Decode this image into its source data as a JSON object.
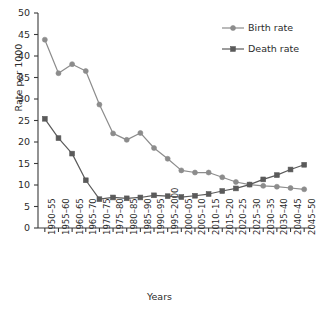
{
  "chart_data": {
    "type": "line",
    "title": "",
    "xlabel": "Years",
    "ylabel": "Rate per 1000",
    "ylim": [
      0,
      50
    ],
    "ytick_step": 5,
    "grid": false,
    "legend_position": "top-right",
    "categories": [
      "1950–55",
      "1955–60",
      "1960–65",
      "1965–70",
      "1970–75",
      "1975–80",
      "1980–85",
      "1985–90",
      "1990–95",
      "1995–2000",
      "2000–05",
      "2005–10",
      "2010–15",
      "2015–20",
      "2020–25",
      "2025–30",
      "2030–35",
      "2035–40",
      "2040–45",
      "2045–50"
    ],
    "yticks": [
      "0",
      "5",
      "10",
      "15",
      "20",
      "25",
      "30",
      "35",
      "40",
      "45",
      "50"
    ],
    "series": [
      {
        "name": "Birth rate",
        "marker": "circle",
        "color": "#8c8c8c",
        "values": [
          43.8,
          36.0,
          38.1,
          36.5,
          28.7,
          22.0,
          20.5,
          22.1,
          18.6,
          16.1,
          13.4,
          12.9,
          12.9,
          11.8,
          10.7,
          10.1,
          9.8,
          9.6,
          9.3,
          9.0
        ]
      },
      {
        "name": "Death rate",
        "marker": "square",
        "color": "#5a5a5a",
        "values": [
          25.4,
          20.9,
          17.3,
          11.1,
          6.7,
          7.1,
          6.9,
          7.1,
          7.6,
          7.4,
          7.2,
          7.5,
          7.9,
          8.6,
          9.2,
          10.1,
          11.3,
          12.3,
          13.6,
          14.7
        ]
      }
    ]
  },
  "legend": {
    "items": [
      {
        "label": "Birth rate"
      },
      {
        "label": "Death rate"
      }
    ]
  },
  "axes": {
    "y_label": "Rate per 1000",
    "x_label": "Years"
  },
  "colors": {
    "birth": "#8c8c8c",
    "death": "#5a5a5a",
    "axis": "#3a3a3a",
    "text": "#2b2b2b",
    "background": "#ffffff"
  }
}
